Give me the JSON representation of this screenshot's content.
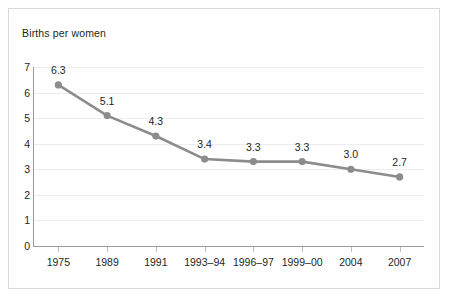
{
  "chart_data": {
    "type": "line",
    "title": "Births per women",
    "xlabel": "",
    "ylabel": "Births per women",
    "categories": [
      "1975",
      "1989",
      "1991",
      "1993–94",
      "1996–97",
      "1999–00",
      "2004",
      "2007"
    ],
    "values": [
      6.3,
      5.1,
      4.3,
      3.4,
      3.3,
      3.3,
      3.0,
      2.7
    ],
    "point_labels": [
      "6.3",
      "5.1",
      "4.3",
      "3.4",
      "3.3",
      "3.3",
      "3.0",
      "2.7"
    ],
    "ylim": [
      0,
      7
    ],
    "ytick_labels": [
      "7",
      "6",
      "5",
      "4",
      "3",
      "2",
      "1",
      "0"
    ],
    "ytick_values": [
      7,
      6,
      5,
      4,
      3,
      2,
      1,
      0
    ],
    "grid": true,
    "grid_axis": "y",
    "legend": "none",
    "series": [
      {
        "name": "Births per women",
        "values": [
          6.3,
          5.1,
          4.3,
          3.4,
          3.3,
          3.3,
          3.0,
          2.7
        ]
      }
    ],
    "colors": {
      "line": "#8c8c8c",
      "marker": "#8c8c8c",
      "gridline": "#ededed",
      "axis": "#9a9a9a",
      "text": "#231f20",
      "border": "#d9d9d9",
      "background": "#ffffff"
    }
  },
  "axis_title": "Births per women"
}
